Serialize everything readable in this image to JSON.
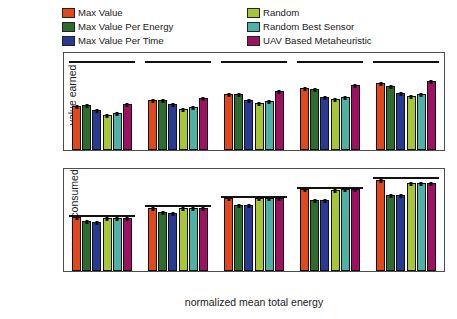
{
  "figure": {
    "legend": {
      "position": "above-axes",
      "entries": [
        {
          "label": "Max Value",
          "color": "#e0481c",
          "icon": "legend-swatch"
        },
        {
          "label": "Max Value Per Energy",
          "color": "#2d6b2f",
          "icon": "legend-swatch"
        },
        {
          "label": "Max Value Per Time",
          "color": "#2a3a93",
          "icon": "legend-swatch"
        },
        {
          "label": "Random",
          "color": "#a8c535",
          "icon": "legend-swatch"
        },
        {
          "label": "Random Best Sensor",
          "color": "#4fb0a5",
          "icon": "legend-swatch"
        },
        {
          "label": "UAV Based Metaheuristic",
          "color": "#9e1060",
          "icon": "legend-swatch"
        }
      ]
    }
  },
  "chart_data": [
    {
      "type": "bar",
      "id": "value-earned",
      "title": "",
      "xlabel": "normalized mean total energy",
      "ylabel": "value earned",
      "categories": [
        "0.5",
        "0.6",
        "0.7",
        "0.8",
        "0.9"
      ],
      "xticks": [
        "0.5",
        "0.6",
        "0.7",
        "0.8",
        "0.9"
      ],
      "yticks": [
        0,
        500,
        1000
      ],
      "ylim": [
        0,
        1000
      ],
      "grid": false,
      "legend_position": "above",
      "annotations": [
        {
          "type": "horizontal-reference-line",
          "group": "0.5",
          "value": 900
        },
        {
          "type": "horizontal-reference-line",
          "group": "0.6",
          "value": 900
        },
        {
          "type": "horizontal-reference-line",
          "group": "0.7",
          "value": 900
        },
        {
          "type": "horizontal-reference-line",
          "group": "0.8",
          "value": 900
        },
        {
          "type": "horizontal-reference-line",
          "group": "0.9",
          "value": 900
        }
      ],
      "series": [
        {
          "name": "Max Value",
          "color": "#e0481c",
          "values": [
            455,
            513,
            578,
            640,
            695
          ]
        },
        {
          "name": "Max Value Per Energy",
          "color": "#2d6b2f",
          "values": [
            463,
            518,
            573,
            630,
            665
          ]
        },
        {
          "name": "Max Value Per Time",
          "color": "#2a3a93",
          "values": [
            408,
            475,
            520,
            550,
            585
          ]
        },
        {
          "name": "Random",
          "color": "#a8c535",
          "values": [
            365,
            425,
            480,
            525,
            560
          ]
        },
        {
          "name": "Random Best Sensor",
          "color": "#4fb0a5",
          "values": [
            385,
            448,
            505,
            545,
            580
          ]
        },
        {
          "name": "UAV Based Metaheuristic",
          "color": "#9e1060",
          "values": [
            473,
            537,
            605,
            672,
            715
          ]
        }
      ]
    },
    {
      "type": "bar",
      "id": "energy-consumed",
      "title": "",
      "xlabel": "normalized mean total energy",
      "ylabel": "energy consumed",
      "categories": [
        "0.5",
        "0.6",
        "0.7",
        "0.8",
        "0.9"
      ],
      "xticks": [
        "0.5",
        "0.6",
        "0.7",
        "0.8",
        "0.9"
      ],
      "yticks": [
        0,
        20,
        40,
        60
      ],
      "ylim": [
        0,
        68
      ],
      "grid": false,
      "legend_position": "above",
      "annotations": [
        {
          "type": "horizontal-reference-line",
          "group": "0.5",
          "value": 36.0
        },
        {
          "type": "horizontal-reference-line",
          "group": "0.6",
          "value": 42.5
        },
        {
          "type": "horizontal-reference-line",
          "group": "0.7",
          "value": 49.0
        },
        {
          "type": "horizontal-reference-line",
          "group": "0.8",
          "value": 55.0
        },
        {
          "type": "horizontal-reference-line",
          "group": "0.9",
          "value": 61.5
        }
      ],
      "series": [
        {
          "name": "Max Value",
          "color": "#e0481c",
          "values": [
            36.0,
            42.3,
            48.5,
            54.5,
            60.5
          ]
        },
        {
          "name": "Max Value Per Energy",
          "color": "#2d6b2f",
          "values": [
            33.5,
            39.3,
            44.0,
            47.5,
            50.5
          ]
        },
        {
          "name": "Max Value Per Time",
          "color": "#2a3a93",
          "values": [
            33.0,
            38.5,
            44.0,
            47.5,
            51.0
          ]
        },
        {
          "name": "Random",
          "color": "#a8c535",
          "values": [
            35.5,
            42.0,
            48.5,
            54.0,
            59.0
          ]
        },
        {
          "name": "Random Best Sensor",
          "color": "#4fb0a5",
          "values": [
            35.5,
            42.3,
            48.5,
            54.5,
            59.0
          ]
        },
        {
          "name": "UAV Based Metaheuristic",
          "color": "#9e1060",
          "values": [
            35.5,
            42.3,
            48.5,
            54.5,
            59.0
          ]
        }
      ]
    }
  ]
}
